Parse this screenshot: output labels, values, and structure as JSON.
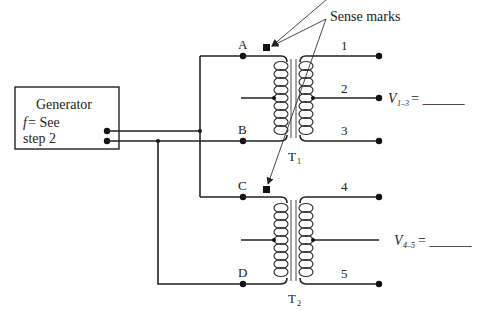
{
  "diagram": {
    "type": "transformer-test-circuit",
    "generator": {
      "title": "Generator",
      "freq_symbol": "f",
      "freq_text": " = See",
      "freq_text2": "step 2"
    },
    "annotation": "Sense marks",
    "transformers": [
      {
        "label": "T",
        "subscript": "1",
        "primary_terminals": [
          "A",
          "B"
        ],
        "secondary_terminals": [
          "1",
          "2",
          "3"
        ],
        "measurement": {
          "symbol": "V",
          "subscript": "1–3",
          "text": " = ______"
        }
      },
      {
        "label": "T",
        "subscript": "2",
        "primary_terminals": [
          "C",
          "D"
        ],
        "secondary_terminals": [
          "4",
          "5"
        ],
        "measurement": {
          "symbol": "V",
          "subscript": "4–5",
          "text": " = ______"
        }
      }
    ],
    "colors": {
      "line": "#222222",
      "background": "#ffffff"
    }
  }
}
